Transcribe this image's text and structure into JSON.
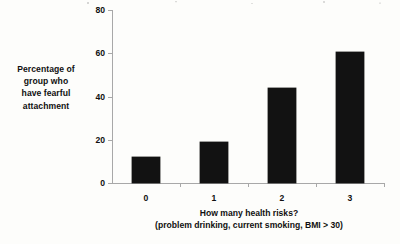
{
  "chart_data": {
    "type": "bar",
    "title": "",
    "subtitle": "",
    "categories": [
      "0",
      "1",
      "2",
      "3"
    ],
    "values": [
      12,
      19,
      44,
      60.5
    ],
    "series": [
      {
        "name": "Percentage of group who have fearful attachment",
        "values": [
          12,
          19,
          44,
          60.5
        ]
      }
    ],
    "xlabel": "How many health risks? (problem drinking, current smoking, BMI > 30)",
    "xlabel_lines": [
      "How many health risks?",
      "(problem drinking, current smoking, BMI > 30)"
    ],
    "ylabel": "Percentage of group who have fearful attachment",
    "ylabel_lines": [
      "Percentage of",
      "group who",
      "have fearful",
      "attachment"
    ],
    "ylim": [
      0,
      80
    ],
    "yticks": [
      0,
      20,
      40,
      60,
      80
    ],
    "ytick_labels": [
      "0",
      "20",
      "40",
      "60",
      "80"
    ],
    "xtick_labels": [
      "0",
      "1",
      "2",
      "3"
    ],
    "grid": false,
    "legend": false,
    "legend_position": "none",
    "colors": {
      "bar_fill": "#121212",
      "axis_line": "#a8a8a8",
      "text": "#101010",
      "background": "#fdfdfb"
    }
  }
}
